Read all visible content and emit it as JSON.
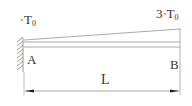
{
  "diagram": {
    "left_temperature": {
      "prefix": "",
      "mark": "∘",
      "symbol": "T",
      "subscript": "0"
    },
    "right_temperature": {
      "prefix": "3",
      "mark": "∘",
      "symbol": "T",
      "subscript": "0"
    },
    "point_a": "A",
    "point_b": "B",
    "length_label": "L",
    "colors": {
      "line": "#9a9a9a",
      "text": "#333333",
      "arrow": "#222222"
    }
  }
}
